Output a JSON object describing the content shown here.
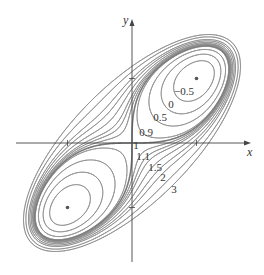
{
  "chart_data": {
    "type": "contour",
    "title": "",
    "function": "x^4 + y^4 - 4xy + 1",
    "xlabel": "x",
    "ylabel": "y",
    "xlim": [
      -1.8,
      1.8
    ],
    "ylim": [
      -1.85,
      1.9
    ],
    "x_ticks": [
      -1,
      1
    ],
    "y_ticks": [
      -1,
      1
    ],
    "grid": false,
    "legend": "none",
    "levels": [
      -0.5,
      0,
      0.5,
      0.9,
      1,
      1.1,
      1.2,
      1.3,
      1.5,
      1.75,
      2,
      2.5,
      3
    ],
    "emphasized_level": 1,
    "contour_labels": [
      {
        "text": "−0.5",
        "level": -0.5,
        "px": 184,
        "py": 95
      },
      {
        "text": "0",
        "level": 0,
        "px": 171,
        "py": 108
      },
      {
        "text": "0.5",
        "level": 0.5,
        "px": 160,
        "py": 121
      },
      {
        "text": "0.9",
        "level": 0.9,
        "px": 146,
        "py": 136
      },
      {
        "text": "1",
        "level": 1,
        "px": 136,
        "py": 149
      },
      {
        "text": "1.1",
        "level": 1.1,
        "px": 143,
        "py": 160
      },
      {
        "text": "1.5",
        "level": 1.5,
        "px": 155,
        "py": 171
      },
      {
        "text": "2",
        "level": 2,
        "px": 163,
        "py": 181
      },
      {
        "text": "3",
        "level": 3,
        "px": 174,
        "py": 193
      }
    ],
    "critical_points": [
      {
        "x": 1,
        "y": 1,
        "value": -1,
        "kind": "minimum"
      },
      {
        "x": -1,
        "y": -1,
        "value": -1,
        "kind": "minimum"
      },
      {
        "x": 0,
        "y": 0,
        "value": 1,
        "kind": "saddle"
      }
    ]
  },
  "layout": {
    "origin_px": [
      132,
      143
    ],
    "scale_px": 64.5,
    "x_axis_px": [
      16,
      251
    ],
    "y_axis_px": [
      262,
      19
    ],
    "x_label_px": [
      247,
      156
    ],
    "y_label_px": [
      123,
      24
    ]
  },
  "colors": {
    "contour": "#8a8a8a",
    "emphasized": "#7a7a7a",
    "axis": "#444444",
    "point": "#555555"
  }
}
